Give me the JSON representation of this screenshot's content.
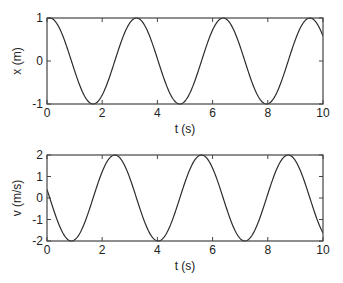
{
  "figure": {
    "background": "#ffffff",
    "line_color": "#2b2b2b",
    "axis_color": "#444444"
  },
  "chart_data": [
    {
      "type": "line",
      "title": "",
      "xlabel": "t (s)",
      "ylabel": "x (m)",
      "xlim": [
        0,
        10
      ],
      "ylim": [
        -1,
        1
      ],
      "xticks": [
        0,
        2,
        4,
        6,
        8,
        10
      ],
      "xtick_labels": [
        "0",
        "2",
        "4",
        "6",
        "8",
        "10"
      ],
      "yticks": [
        -1,
        0,
        1
      ],
      "ytick_labels": [
        "-1",
        "0",
        "1"
      ],
      "grid": false,
      "legend": null,
      "series": [
        {
          "name": "x(t)",
          "description": "cosine, amplitude 1, period ~3.14 s, peak near t=0.1",
          "x": [
            0,
            0.1,
            0.5,
            0.885,
            1.27,
            1.67,
            2.06,
            2.45,
            2.84,
            3.24,
            3.63,
            4.03,
            4.42,
            4.81,
            5.2,
            5.6,
            6.0,
            6.38,
            6.77,
            7.17,
            7.56,
            7.95,
            8.34,
            8.74,
            9.13,
            9.52,
            9.91,
            10
          ],
          "values": [
            0.98,
            1.0,
            0.7,
            0.0,
            -0.7,
            -1.0,
            -0.7,
            0.0,
            0.7,
            1.0,
            0.7,
            0.0,
            -0.7,
            -1.0,
            -0.7,
            0.0,
            0.7,
            1.0,
            0.7,
            0.0,
            -0.7,
            -1.0,
            -0.7,
            0.0,
            0.7,
            1.0,
            0.7,
            0.6
          ]
        }
      ],
      "model": {
        "amplitude": 1,
        "omega": 2,
        "t0": 0.1,
        "func": "cos"
      }
    },
    {
      "type": "line",
      "title": "",
      "xlabel": "t (s)",
      "ylabel": "v (m/s)",
      "xlim": [
        0,
        10
      ],
      "ylim": [
        -2,
        2
      ],
      "xticks": [
        0,
        2,
        4,
        6,
        8,
        10
      ],
      "xtick_labels": [
        "0",
        "2",
        "4",
        "6",
        "8",
        "10"
      ],
      "yticks": [
        -2,
        -1,
        0,
        1,
        2
      ],
      "ytick_labels": [
        "-2",
        "-1",
        "0",
        "1",
        "2"
      ],
      "grid": false,
      "legend": null,
      "series": [
        {
          "name": "v(t)",
          "description": "negative sine, amplitude 2, period ~3.14 s, starts at ~0.4",
          "x": [
            0,
            0.1,
            0.5,
            0.885,
            1.27,
            1.67,
            2.06,
            2.45,
            2.84,
            3.24,
            3.63,
            4.03,
            4.42,
            4.81,
            5.2,
            5.6,
            6.0,
            6.38,
            6.77,
            7.17,
            7.56,
            7.95,
            8.34,
            8.74,
            9.13,
            9.52,
            9.91,
            10
          ],
          "values": [
            0.4,
            0.0,
            -1.43,
            -2.0,
            -1.43,
            0.0,
            1.43,
            2.0,
            1.43,
            0.0,
            -1.43,
            -2.0,
            -1.43,
            0.0,
            1.43,
            2.0,
            1.43,
            0.0,
            -1.43,
            -2.0,
            -1.43,
            0.0,
            1.43,
            2.0,
            1.43,
            0.0,
            -1.43,
            -1.6
          ]
        }
      ],
      "model": {
        "amplitude": -2,
        "omega": 2,
        "t0": 0.1,
        "func": "sin"
      }
    }
  ],
  "panels": [
    {
      "xlabel": "t (s)",
      "ylabel": "x (m)"
    },
    {
      "xlabel": "t (s)",
      "ylabel": "v (m/s)"
    }
  ]
}
